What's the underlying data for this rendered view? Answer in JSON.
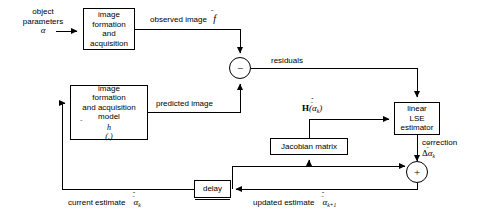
{
  "diagram": {
    "stroke_color": "#000000",
    "background_color": "#ffffff",
    "blocks": {
      "image_formation_acquisition": {
        "line1": "image",
        "line2": "formation",
        "line3": "and",
        "line4": "acquisition"
      },
      "image_formation_acquisition_model": {
        "line1": "image",
        "line2": "formation",
        "line3": "and acquisition",
        "line4": "model",
        "line5_base": "h",
        "line5_tail": "(.)"
      },
      "linear_lse_estimator": {
        "line1": "linear",
        "line2": "LSE",
        "line3": "estimator"
      },
      "jacobian_matrix": {
        "label": "Jacobian matrix"
      },
      "delay": {
        "label": "delay"
      }
    },
    "junctions": {
      "subtract": {
        "symbol": "−",
        "name": "summing-junction-subtract"
      },
      "add": {
        "symbol": "+",
        "name": "summing-junction-add"
      }
    },
    "labels": {
      "object_parameters_l1": "object",
      "object_parameters_l2": "parameters",
      "object_parameters_sym": "α",
      "observed_image": "observed image",
      "observed_image_sym": "f",
      "predicted_image": "predicted image",
      "residuals": "residuals",
      "jacobian_signal_fn": "H",
      "jacobian_signal_arg_open": "(",
      "jacobian_signal_sym": "α",
      "jacobian_signal_sub": "k",
      "jacobian_signal_arg_close": ")",
      "correction": "correction",
      "correction_delta": "Δ",
      "correction_sym": "α",
      "correction_sub": "k",
      "current_estimate": "current estimate",
      "current_estimate_sym": "α",
      "current_estimate_sub": "k",
      "updated_estimate": "updated estimate",
      "updated_estimate_sym": "α",
      "updated_estimate_sub": "k+1"
    }
  }
}
